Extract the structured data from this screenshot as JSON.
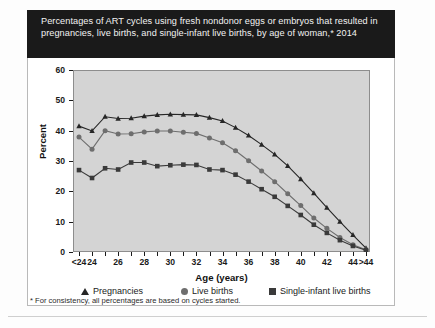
{
  "title": {
    "text": "Percentages of ART cycles using fresh nondonor eggs or embryos that resulted in pregnancies, live births, and single-infant live births, by age of woman,* 2014"
  },
  "footnote": {
    "text": "* For consistency, all percentages are based on cycles started."
  },
  "axes": {
    "ylabel": "Percent",
    "xlabel": "Age (years)"
  },
  "legend": {
    "items": [
      {
        "label": "Pregnancies",
        "marker": "triangle",
        "color": "#262626"
      },
      {
        "label": "Live births",
        "marker": "circle",
        "color": "#6e6e6e"
      },
      {
        "label": "Single-infant live births",
        "marker": "square",
        "color": "#3a3a3a"
      }
    ]
  },
  "colors": {
    "plot_background": "#d4d4d4",
    "panel_background": "#ffffff",
    "title_background": "#1a1a1a",
    "title_text": "#f2f2f2",
    "axis": "#1a1a1a"
  },
  "chart_data": {
    "type": "line",
    "title": "Percentages of ART cycles using fresh nondonor eggs or embryos that resulted in pregnancies, live births, and single-infant live births, by age of woman,* 2014",
    "xlabel": "Age (years)",
    "ylabel": "Percent",
    "ylim": [
      0,
      60
    ],
    "yticks": [
      0,
      10,
      20,
      30,
      40,
      50,
      60
    ],
    "ytick_labels": [
      "0",
      "10",
      "20",
      "30",
      "40",
      "50",
      "60"
    ],
    "grid": false,
    "legend_position": "below-axis",
    "categories": [
      "<24",
      "24",
      "25",
      "26",
      "27",
      "28",
      "29",
      "30",
      "31",
      "32",
      "33",
      "34",
      "35",
      "36",
      "37",
      "38",
      "39",
      "40",
      "41",
      "42",
      "43",
      "44",
      ">44"
    ],
    "xtick_labels": [
      "<24",
      "24",
      "26",
      "28",
      "30",
      "32",
      "34",
      "36",
      "38",
      "40",
      "42",
      "44",
      ">44"
    ],
    "series": [
      {
        "name": "Pregnancies",
        "marker": "triangle",
        "color": "#262626",
        "values": [
          41.5,
          39.9,
          44.6,
          44.0,
          44.1,
          44.8,
          45.2,
          45.4,
          45.3,
          45.2,
          44.3,
          43.2,
          41.0,
          38.4,
          35.4,
          32.2,
          28.4,
          24.0,
          19.4,
          14.6,
          10.0,
          5.6,
          1.3
        ]
      },
      {
        "name": "Live births",
        "marker": "circle",
        "color": "#6e6e6e",
        "values": [
          37.9,
          33.9,
          40.0,
          38.9,
          39.0,
          39.6,
          39.9,
          39.9,
          39.5,
          39.1,
          37.6,
          36.0,
          33.4,
          30.1,
          26.7,
          23.2,
          19.2,
          15.3,
          11.2,
          7.8,
          4.8,
          2.4,
          0.7
        ]
      },
      {
        "name": "Single-infant live births",
        "marker": "square",
        "color": "#3a3a3a",
        "values": [
          27.0,
          24.4,
          27.6,
          27.2,
          29.5,
          29.5,
          28.3,
          28.6,
          28.8,
          28.7,
          27.2,
          27.0,
          25.5,
          23.2,
          20.7,
          18.2,
          15.2,
          12.2,
          9.0,
          6.3,
          3.9,
          2.0,
          0.6
        ]
      }
    ]
  }
}
